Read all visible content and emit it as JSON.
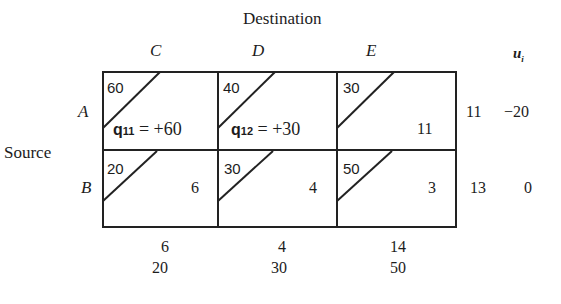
{
  "title": "Destination",
  "row_axis_label": "Source",
  "columns": [
    "C",
    "D",
    "E"
  ],
  "ui_header": "u_i",
  "rows": [
    {
      "label": "A",
      "cells": [
        {
          "cost": "60",
          "value": "",
          "note": {
            "var": "q",
            "sub": "11",
            "expr": "= +60"
          }
        },
        {
          "cost": "40",
          "value": "",
          "note": {
            "var": "q",
            "sub": "12",
            "expr": "= +30"
          }
        },
        {
          "cost": "30",
          "value": "11",
          "note": null
        }
      ],
      "row_value": "11",
      "u": "−20"
    },
    {
      "label": "B",
      "cells": [
        {
          "cost": "20",
          "value": "6",
          "note": null
        },
        {
          "cost": "30",
          "value": "4",
          "note": null
        },
        {
          "cost": "50",
          "value": "3",
          "note": null
        }
      ],
      "row_value": "13",
      "u": "0"
    }
  ],
  "column_totals": [
    "6",
    "4",
    "14"
  ],
  "v_values": [
    "20",
    "30",
    "50"
  ]
}
